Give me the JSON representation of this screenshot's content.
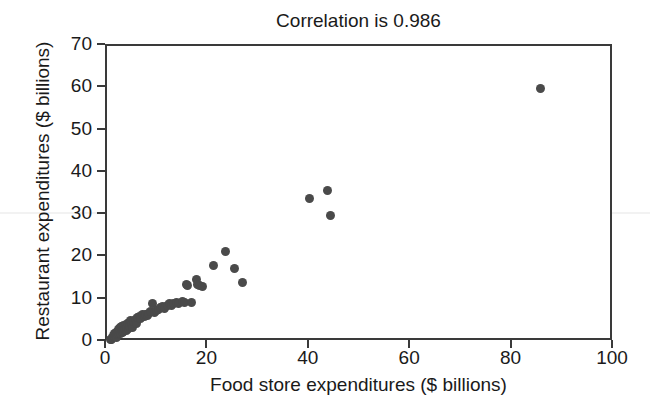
{
  "chart_data": {
    "type": "scatter",
    "title": "Correlation is 0.986",
    "xlabel": "Food store expenditures ($ billions)",
    "ylabel": "Restaurant expenditures ($ billions)",
    "xlim": [
      0,
      100
    ],
    "ylim": [
      0,
      70
    ],
    "xticks": [
      0,
      20,
      40,
      60,
      80,
      100
    ],
    "yticks": [
      0,
      10,
      20,
      30,
      40,
      50,
      60,
      70
    ],
    "xtick_labels": [
      "0",
      "20",
      "40",
      "60",
      "80",
      "100"
    ],
    "ytick_labels": [
      "0",
      "10",
      "20",
      "30",
      "40",
      "50",
      "60",
      "70"
    ],
    "grid": false,
    "legend": null,
    "marker_color": "#4a4a4a",
    "marker_size_px": 9,
    "axis_color": "#3a3a3a",
    "annotations": [
      "Correlation is 0.986"
    ],
    "series": [
      {
        "name": "States",
        "points": [
          [
            0.6,
            0.5
          ],
          [
            0.9,
            0.7
          ],
          [
            1.1,
            1.0
          ],
          [
            1.2,
            1.6
          ],
          [
            1.4,
            1.2
          ],
          [
            1.5,
            2.0
          ],
          [
            1.7,
            1.5
          ],
          [
            1.8,
            2.3
          ],
          [
            1.9,
            1.1
          ],
          [
            2.0,
            2.6
          ],
          [
            2.1,
            1.8
          ],
          [
            2.2,
            2.9
          ],
          [
            2.3,
            2.1
          ],
          [
            2.4,
            3.1
          ],
          [
            2.5,
            2.4
          ],
          [
            2.6,
            3.4
          ],
          [
            2.7,
            1.9
          ],
          [
            2.8,
            2.7
          ],
          [
            2.9,
            3.6
          ],
          [
            3.0,
            2.2
          ],
          [
            3.1,
            3.0
          ],
          [
            3.2,
            3.8
          ],
          [
            3.3,
            2.5
          ],
          [
            3.4,
            3.3
          ],
          [
            3.6,
            4.0
          ],
          [
            3.8,
            2.8
          ],
          [
            3.9,
            3.5
          ],
          [
            4.0,
            4.3
          ],
          [
            4.2,
            3.1
          ],
          [
            4.4,
            4.6
          ],
          [
            4.5,
            3.7
          ],
          [
            4.7,
            5.0
          ],
          [
            4.9,
            4.1
          ],
          [
            5.1,
            3.4
          ],
          [
            5.3,
            4.8
          ],
          [
            5.6,
            5.3
          ],
          [
            5.9,
            4.4
          ],
          [
            6.1,
            5.7
          ],
          [
            6.4,
            6.1
          ],
          [
            6.7,
            5.5
          ],
          [
            7.0,
            6.4
          ],
          [
            7.3,
            6.0
          ],
          [
            7.6,
            6.6
          ],
          [
            7.9,
            6.2
          ],
          [
            8.2,
            6.8
          ],
          [
            8.6,
            7.2
          ],
          [
            9.0,
            9.0
          ],
          [
            9.3,
            7.0
          ],
          [
            9.7,
            7.4
          ],
          [
            10.1,
            7.8
          ],
          [
            10.5,
            8.1
          ],
          [
            11.0,
            8.4
          ],
          [
            11.4,
            8.0
          ],
          [
            11.9,
            8.7
          ],
          [
            12.3,
            9.0
          ],
          [
            12.8,
            8.6
          ],
          [
            13.2,
            9.2
          ],
          [
            13.7,
            9.4
          ],
          [
            14.2,
            9.0
          ],
          [
            14.8,
            9.5
          ],
          [
            15.3,
            9.3
          ],
          [
            15.6,
            13.6
          ],
          [
            15.9,
            13.4
          ],
          [
            16.6,
            9.4
          ],
          [
            17.6,
            14.8
          ],
          [
            17.9,
            13.5
          ],
          [
            18.3,
            13.3
          ],
          [
            18.8,
            13.2
          ],
          [
            21.0,
            18.0
          ],
          [
            23.3,
            21.3
          ],
          [
            25.1,
            17.5
          ],
          [
            26.8,
            14.0
          ],
          [
            39.9,
            34.0
          ],
          [
            43.4,
            35.8
          ],
          [
            44.0,
            30.0
          ],
          [
            85.5,
            60.0
          ]
        ]
      }
    ]
  },
  "axis": {
    "title": "Correlation is 0.986",
    "xlabel": "Food store expenditures ($ billions)",
    "ylabel": "Restaurant expenditures ($ billions)"
  }
}
